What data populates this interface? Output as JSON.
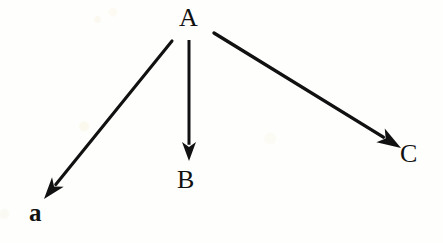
{
  "diagram": {
    "background_color": "#fefefd",
    "ink_color": "#111111",
    "nodes": [
      {
        "id": "A",
        "label": "A",
        "x": 190,
        "y": 18,
        "role": "source"
      },
      {
        "id": "a",
        "label": "a",
        "x": 37,
        "y": 211,
        "role": "target"
      },
      {
        "id": "B",
        "label": "B",
        "x": 186,
        "y": 180,
        "role": "target"
      },
      {
        "id": "C",
        "label": "C",
        "x": 410,
        "y": 155,
        "role": "target"
      }
    ],
    "arrows": [
      {
        "id": "A-to-a",
        "from": "A",
        "to": "a",
        "start_x": 172,
        "start_y": 41,
        "end_x": 44,
        "end_y": 199,
        "direction": "down-left"
      },
      {
        "id": "A-to-B",
        "from": "A",
        "to": "B",
        "start_x": 189,
        "start_y": 40,
        "end_x": 189,
        "end_y": 161,
        "direction": "down"
      },
      {
        "id": "A-to-C",
        "from": "A",
        "to": "C",
        "start_x": 214,
        "start_y": 33,
        "end_x": 401,
        "end_y": 148,
        "direction": "down-right"
      }
    ]
  }
}
